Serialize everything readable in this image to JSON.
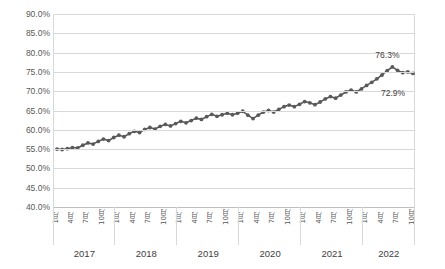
{
  "chart_data": {
    "type": "line",
    "title": "",
    "subtitle": "",
    "xlabel": "",
    "ylabel": "",
    "ylim": [
      40,
      90
    ],
    "ytick_labels": [
      "90.0%",
      "85.0%",
      "80.0%",
      "75.0%",
      "70.0%",
      "65.0%",
      "60.0%",
      "55.0%",
      "50.0%",
      "45.0%",
      "40.0%"
    ],
    "ytick_values": [
      90,
      85,
      80,
      75,
      70,
      65,
      60,
      55,
      50,
      45,
      40
    ],
    "grid": true,
    "legend": "none",
    "series_color": "#595959",
    "marker": "circle",
    "years": [
      "2017",
      "2018",
      "2019",
      "2020",
      "2021",
      "2022"
    ],
    "xtick_labels": [
      "1月",
      "4月",
      "7月",
      "10月",
      "1月",
      "4月",
      "7月",
      "10月",
      "1月",
      "4月",
      "7月",
      "10月",
      "1月",
      "4月",
      "7月",
      "10月",
      "1月",
      "4月",
      "7月",
      "10月",
      "1月",
      "4月",
      "7月",
      "10月"
    ],
    "x": [
      "2017-01",
      "2017-02",
      "2017-03",
      "2017-04",
      "2017-05",
      "2017-06",
      "2017-07",
      "2017-08",
      "2017-09",
      "2017-10",
      "2017-11",
      "2017-12",
      "2018-01",
      "2018-02",
      "2018-03",
      "2018-04",
      "2018-05",
      "2018-06",
      "2018-07",
      "2018-08",
      "2018-09",
      "2018-10",
      "2018-11",
      "2018-12",
      "2019-01",
      "2019-02",
      "2019-03",
      "2019-04",
      "2019-05",
      "2019-06",
      "2019-07",
      "2019-08",
      "2019-09",
      "2019-10",
      "2019-11",
      "2019-12",
      "2020-01",
      "2020-02",
      "2020-03",
      "2020-04",
      "2020-05",
      "2020-06",
      "2020-07",
      "2020-08",
      "2020-09",
      "2020-10",
      "2020-11",
      "2020-12",
      "2021-01",
      "2021-02",
      "2021-03",
      "2021-04",
      "2021-05",
      "2021-06",
      "2021-07",
      "2021-08",
      "2021-09",
      "2021-10",
      "2021-11",
      "2021-12",
      "2022-01",
      "2022-02",
      "2022-03",
      "2022-04",
      "2022-05",
      "2022-06",
      "2022-07",
      "2022-08",
      "2022-09",
      "2022-10"
    ],
    "values": [
      55.0,
      54.9,
      55.1,
      55.4,
      55.3,
      56.0,
      56.6,
      56.3,
      57.0,
      57.6,
      57.2,
      58.0,
      58.6,
      58.2,
      59.0,
      59.6,
      59.3,
      60.1,
      60.6,
      60.2,
      60.9,
      61.4,
      61.0,
      61.6,
      62.2,
      61.8,
      62.4,
      63.0,
      62.7,
      63.4,
      64.0,
      63.5,
      63.9,
      64.3,
      63.9,
      64.3,
      64.8,
      63.8,
      62.9,
      63.8,
      64.6,
      65.0,
      64.6,
      65.3,
      66.0,
      66.4,
      66.0,
      66.6,
      67.3,
      67.0,
      66.5,
      67.2,
      68.0,
      68.6,
      68.2,
      69.0,
      69.8,
      70.3,
      69.8,
      70.6,
      71.5,
      72.3,
      73.2,
      74.2,
      75.3,
      76.3,
      75.4,
      74.8,
      75.0,
      74.6
    ],
    "annotations": [
      {
        "label": "76.3%",
        "point": "2022-06",
        "value": 76.3
      },
      {
        "label": "72.9%",
        "point": "2022-10",
        "value": 72.9
      }
    ],
    "final_values": {
      "peak": 76.3,
      "last": 72.9
    }
  }
}
